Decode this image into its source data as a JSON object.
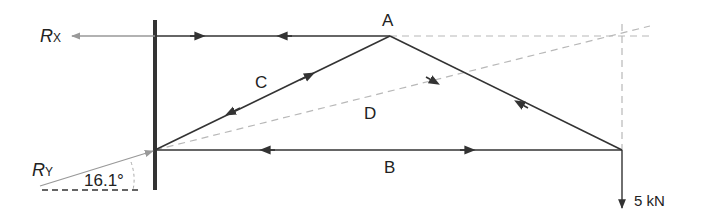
{
  "diagram": {
    "labels": {
      "rx": "R",
      "rx_sub": "X",
      "ry": "R",
      "ry_sub": "Y",
      "angle": "16.1°",
      "node_a": "A",
      "member_b": "B",
      "member_c": "C",
      "member_d": "D",
      "load": "5 kN"
    },
    "colors": {
      "line": "#333333",
      "construction": "#b5b5b5",
      "reaction": "#999999"
    }
  }
}
